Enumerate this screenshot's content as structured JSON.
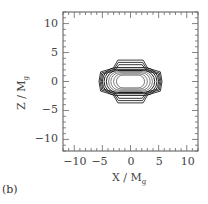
{
  "panel_label": "(b)",
  "chart_data": {
    "type": "contour",
    "title": "",
    "xlabel": "X / M",
    "xlabel_subscript": "g",
    "ylabel": "Z / M",
    "ylabel_subscript": "g",
    "xlim": [
      -12,
      12
    ],
    "ylim": [
      -12,
      12
    ],
    "xticks": [
      -10,
      -5,
      0,
      5,
      10
    ],
    "yticks": [
      -10,
      -5,
      0,
      5,
      10
    ],
    "xtick_labels": [
      "−10",
      "−5",
      "0",
      "5",
      "10"
    ],
    "ytick_labels": [
      "10",
      "5",
      "0",
      "−5",
      "−10"
    ],
    "minor_tick_step": 1,
    "grid": false,
    "legend": null,
    "contours": [
      {
        "level": 1,
        "half_width_x": 5.6,
        "half_height_z": 3.7,
        "shape": "hexagonal-flattened"
      },
      {
        "level": 2,
        "half_width_x": 5.4,
        "half_height_z": 3.3,
        "shape": "hexagonal-flattened"
      },
      {
        "level": 3,
        "half_width_x": 5.2,
        "half_height_z": 2.9,
        "shape": "hexagonal-flattened"
      },
      {
        "level": 4,
        "half_width_x": 5.0,
        "half_height_z": 2.4,
        "shape": "rounded-rect"
      },
      {
        "level": 5,
        "half_width_x": 4.7,
        "half_height_z": 2.1,
        "shape": "rounded-rect"
      },
      {
        "level": 6,
        "half_width_x": 4.3,
        "half_height_z": 1.9,
        "shape": "rounded-rect"
      },
      {
        "level": 7,
        "half_width_x": 3.9,
        "half_height_z": 1.7,
        "shape": "rounded-rect"
      },
      {
        "level": 8,
        "half_width_x": 3.5,
        "half_height_z": 1.5,
        "shape": "rounded-rect"
      },
      {
        "level": 9,
        "half_width_x": 3.0,
        "half_height_z": 1.3,
        "shape": "rounded-rect"
      },
      {
        "level": 10,
        "half_width_x": 2.5,
        "half_height_z": 1.1,
        "shape": "rounded-rect"
      }
    ]
  }
}
